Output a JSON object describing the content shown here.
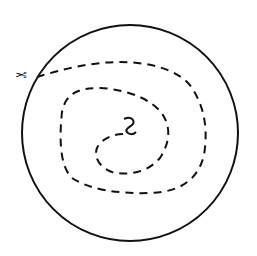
{
  "diagram": {
    "colors": {
      "stroke": "#111111",
      "background": "#ffffff"
    },
    "circle": {
      "cx": 130,
      "cy": 133,
      "r": 108
    },
    "spiral_path": "M 37 77 C 60 70, 90 62, 120 62 C 150 62, 180 70, 192 88 C 205 108, 208 130, 204 155 C 198 180, 180 192, 150 193 C 120 194, 90 190, 72 178 C 58 165, 60 130, 62 112 C 66 92, 80 88, 100 88 C 120 89, 140 95, 152 104 C 168 115, 175 135, 160 158 C 148 172, 130 176, 112 172 C 96 166, 92 152, 100 143 C 108 136, 116 134, 126 134",
    "scissors_icon": "✂",
    "center_curl": "M 124 119 C 132 115, 136 122, 132 125 C 128 128, 124 130, 128 133 C 131 135, 134 134, 136 132"
  }
}
